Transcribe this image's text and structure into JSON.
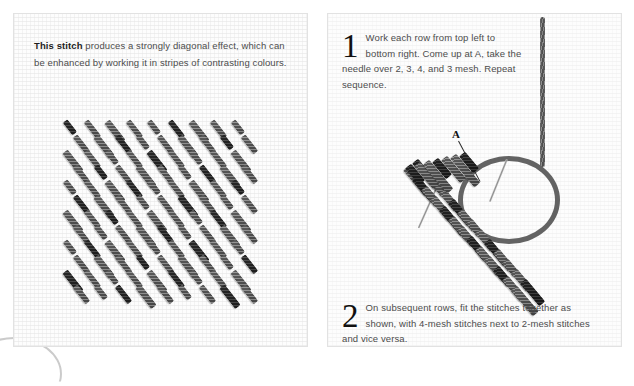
{
  "page": {
    "background": "#ffffff",
    "width": 634,
    "height": 364
  },
  "left_panel": {
    "name": "stitch-sample-panel",
    "caption": {
      "lead": "This stitch",
      "rest": " produces a strongly diagonal effect, which can be enhanced by working it in stripes of contrasting colours."
    },
    "sample_alt": "Worked stitch sample showing diagonal texture on canvas mesh"
  },
  "right_panel": {
    "name": "instruction-panel",
    "steps": [
      {
        "number": "1",
        "text": "Work each row from top left to bottom right. Come up at A, take the needle over 2, 3, 4, and 3 mesh. Repeat sequence."
      },
      {
        "number": "2",
        "text": "On subsequent rows, fit the stitches together as shown, with 4-mesh stitches next to 2-mesh stitches and vice versa."
      }
    ],
    "point_label": "A",
    "diagram_alt": "Needle and thread working diagonal stitches on canvas"
  },
  "colors": {
    "thread": "#5a5a5a",
    "thread_dark": "#262626",
    "canvas": "#fcfcfc",
    "panel_border": "#e2e2e2",
    "text": "#4c4c4c",
    "text_strong": "#1d1d1d",
    "needle": "#9a9a9a"
  }
}
